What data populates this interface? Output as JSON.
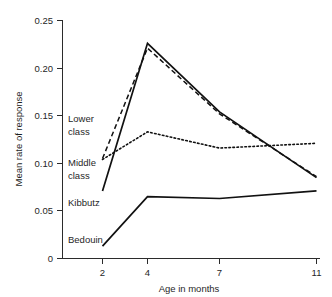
{
  "chart_data": {
    "type": "line",
    "title": "",
    "xlabel": "Age in months",
    "ylabel": "Mean rate of response",
    "x": [
      2,
      4,
      7,
      11
    ],
    "x_tick_labels": [
      "2",
      "4",
      "7",
      "11"
    ],
    "y_tick_labels": [
      "0",
      "0.05",
      "0.10",
      "0.15",
      "0.20",
      "0.25"
    ],
    "y_tick_values": [
      0,
      0.05,
      0.1,
      0.15,
      0.2,
      0.25
    ],
    "xlim": [
      0.8,
      11.8
    ],
    "ylim": [
      0,
      0.25
    ],
    "grid": false,
    "legend_position": "inline-labels",
    "series": [
      {
        "name": "Lower class",
        "style": "dashed",
        "values": [
          0.105,
          0.221,
          0.152,
          0.086
        ]
      },
      {
        "name": "Middle class",
        "style": "dotted",
        "values": [
          0.104,
          0.133,
          0.116,
          0.121
        ]
      },
      {
        "name": "Kibbutz",
        "style": "solid",
        "values": [
          0.071,
          0.226,
          0.154,
          0.085
        ]
      },
      {
        "name": "Bedouin",
        "style": "solid",
        "values": [
          0.013,
          0.065,
          0.063,
          0.071
        ]
      }
    ],
    "annotations": [
      {
        "text": "Lower",
        "series": "Lower class",
        "line": 1
      },
      {
        "text": "class",
        "series": "Lower class",
        "line": 2
      },
      {
        "text": "Middle",
        "series": "Middle class",
        "line": 1
      },
      {
        "text": "class",
        "series": "Middle class",
        "line": 2
      },
      {
        "text": "Kibbutz",
        "series": "Kibbutz",
        "line": 1
      },
      {
        "text": "Bedouin",
        "series": "Bedouin",
        "line": 1
      }
    ],
    "colors": {
      "line": "#111111",
      "axis": "#2b2b2b",
      "text": "#1f1f1f",
      "background": "#ffffff"
    }
  }
}
